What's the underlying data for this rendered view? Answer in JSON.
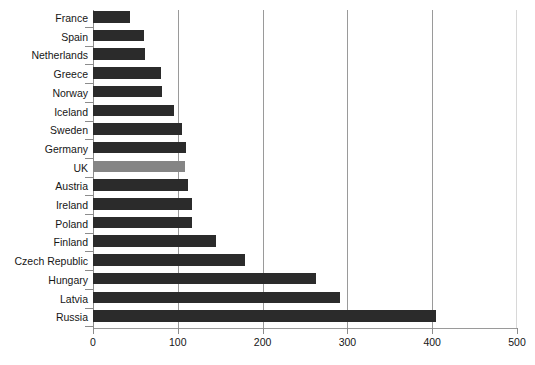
{
  "chart_data": {
    "type": "bar",
    "orientation": "horizontal",
    "title": "",
    "subtitle": "",
    "xlabel": "",
    "ylabel": "",
    "xlim": [
      0,
      500
    ],
    "ylim": null,
    "grid": true,
    "legend": null,
    "xticks": [
      0,
      100,
      200,
      300,
      400,
      500
    ],
    "xtick_labels": [
      "0",
      "100",
      "200",
      "300",
      "400",
      "500"
    ],
    "categories": [
      "France",
      "Spain",
      "Netherlands",
      "Greece",
      "Norway",
      "Iceland",
      "Sweden",
      "Germany",
      "UK",
      "Austria",
      "Ireland",
      "Poland",
      "Finland",
      "Czech Republic",
      "Hungary",
      "Latvia",
      "Russia"
    ],
    "values": [
      44,
      60,
      61,
      80,
      81,
      96,
      105,
      110,
      108,
      112,
      117,
      117,
      145,
      179,
      263,
      291,
      405
    ],
    "highlight_category": "UK",
    "colors": {
      "bar": "#2b2b2b",
      "bar_highlight": "#858585",
      "gridline": "#9a9a9a",
      "gridline_faint": "#d8d8d8",
      "axis": "#8c8c8c",
      "text": "#161616",
      "background": "#ffffff"
    }
  }
}
